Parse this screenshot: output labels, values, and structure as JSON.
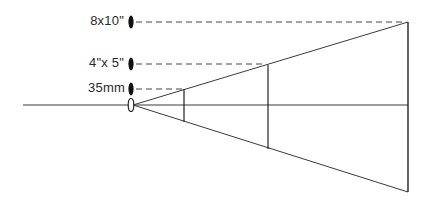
{
  "diagram": {
    "title": "",
    "labels": {
      "large": "8x10\"",
      "medium": "4\"x 5\"",
      "small": "35mm"
    },
    "formats": [
      {
        "name": "8x10\"",
        "label_y": 22,
        "plane_x": 408,
        "top_y": 22,
        "bottom_y": 192
      },
      {
        "name": "4\"x 5\"",
        "label_y": 65,
        "plane_x": 268,
        "top_y": 65,
        "bottom_y": 149
      },
      {
        "name": "35mm",
        "label_y": 89,
        "plane_x": 184,
        "top_y": 89,
        "bottom_y": 122
      }
    ],
    "colors": {
      "line": "#333333",
      "background": "#ffffff"
    }
  }
}
